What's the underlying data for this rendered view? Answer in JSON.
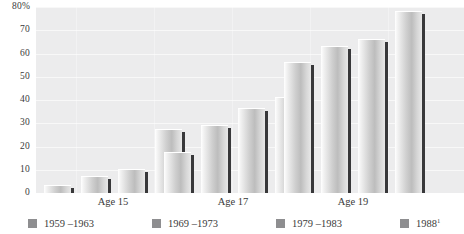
{
  "chart_data": {
    "type": "bar",
    "title": "",
    "subtitle": "",
    "xlabel": "",
    "ylabel": "",
    "ylim": [
      0,
      80
    ],
    "yticks": [
      "0",
      "10",
      "20",
      "30",
      "40",
      "50",
      "60",
      "70",
      "80%"
    ],
    "ytick_values": [
      0,
      10,
      20,
      30,
      40,
      50,
      60,
      70,
      80
    ],
    "grid": true,
    "legend_position": "bottom",
    "categories": [
      "Age 15",
      "Age 17",
      "Age 19"
    ],
    "series": [
      {
        "name": "1959 –1963",
        "values": [
          3,
          17,
          56
        ]
      },
      {
        "name": "1969 –1973",
        "values": [
          7,
          29,
          63
        ]
      },
      {
        "name": "1979 –1983",
        "values": [
          10,
          36,
          66
        ]
      },
      {
        "name": "1988",
        "name_suffix": "1",
        "values": [
          27,
          41,
          78
        ]
      }
    ]
  },
  "colors": {
    "plot_background": "#ececed",
    "page_background": "#ffffff",
    "gridline": "#f8f8f8",
    "bar_light": "#f2f2f2",
    "bar_mid": "#bdbdbd",
    "bar_shadow": "#38383a",
    "legend_swatch": "#8e8e90",
    "text": "#3a3a3a"
  },
  "legend": [
    {
      "label": "1959 –1963",
      "suffix": ""
    },
    {
      "label": "1969 –1973",
      "suffix": ""
    },
    {
      "label": "1979 –1983",
      "suffix": ""
    },
    {
      "label": "1988",
      "suffix": "1"
    }
  ]
}
